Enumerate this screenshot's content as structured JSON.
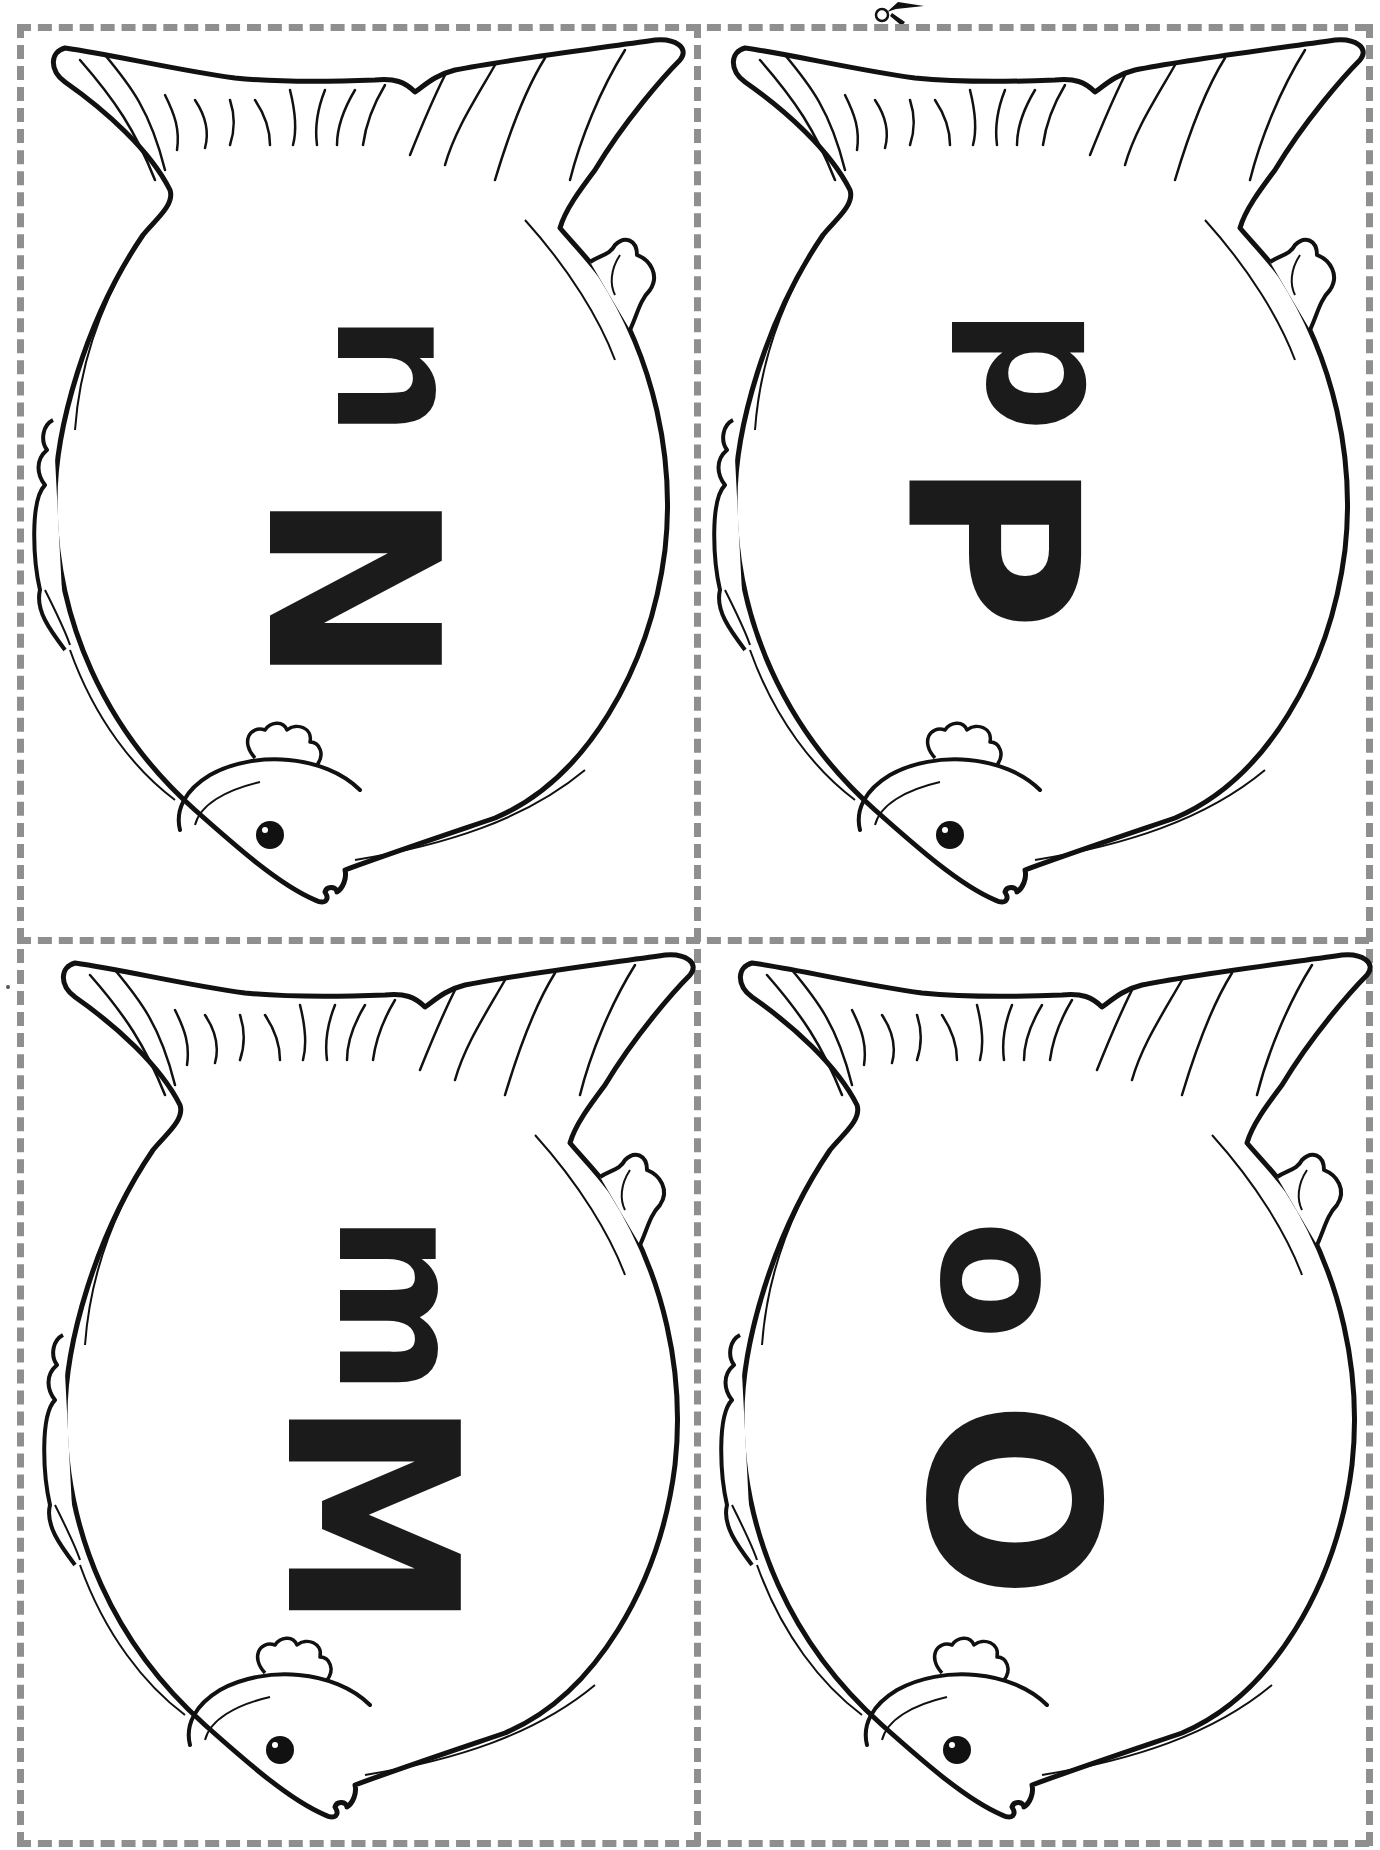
{
  "worksheet": {
    "type": "fish letter cut-out cards",
    "colors": {
      "outline": "#111111",
      "cut_line": "#8f8f8f",
      "letter": "#1b1b1b",
      "background": "#ffffff"
    },
    "icons": {
      "scissors": "scissors-icon"
    },
    "cards": [
      {
        "position": "top-left",
        "uppercase": "N",
        "lowercase": "n"
      },
      {
        "position": "top-right",
        "uppercase": "P",
        "lowercase": "p"
      },
      {
        "position": "bottom-left",
        "uppercase": "M",
        "lowercase": "m"
      },
      {
        "position": "bottom-right",
        "uppercase": "O",
        "lowercase": "o"
      }
    ]
  }
}
